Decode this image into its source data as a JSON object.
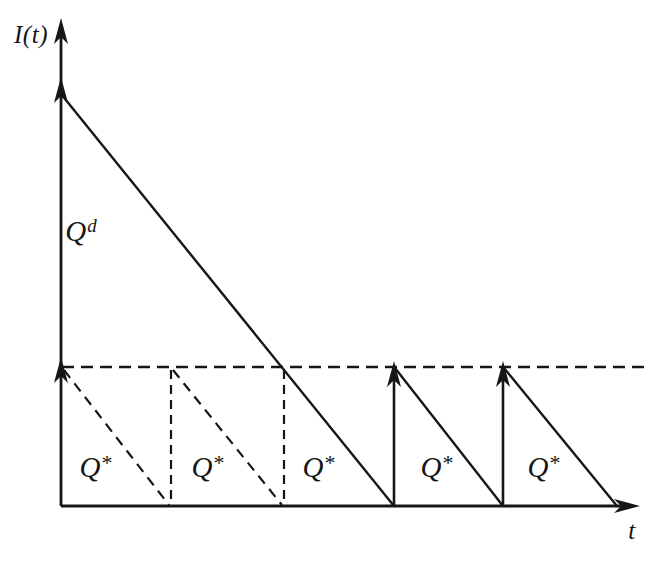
{
  "figure": {
    "background": "#ffffff",
    "ink": "#161616"
  },
  "axes": {
    "y_label": "I(t)",
    "x_label": "t"
  },
  "labels": {
    "initial_order": {
      "base": "Q",
      "sup": "d"
    },
    "cycles": [
      {
        "base": "Q",
        "sup": "*"
      },
      {
        "base": "Q",
        "sup": "*"
      },
      {
        "base": "Q",
        "sup": "*"
      },
      {
        "base": "Q",
        "sup": "*"
      },
      {
        "base": "Q",
        "sup": "*"
      }
    ]
  }
}
